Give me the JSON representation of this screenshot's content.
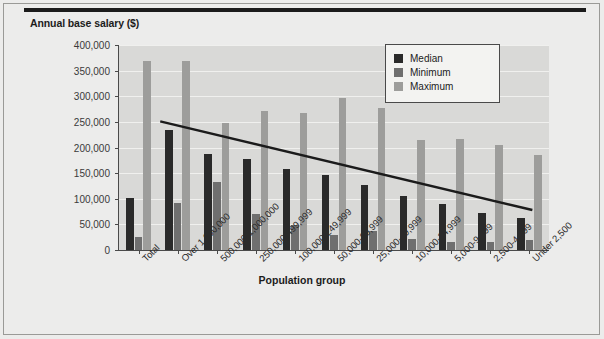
{
  "figure": {
    "y_axis_title": "Annual base salary ($)",
    "x_axis_title": "Population group"
  },
  "legend": {
    "items": [
      {
        "label": "Median",
        "color": "#2a2a2a",
        "swatch_name": "legend-swatch-median"
      },
      {
        "label": "Minimum",
        "color": "#6f6f6f",
        "swatch_name": "legend-swatch-minimum"
      },
      {
        "label": "Maximum",
        "color": "#9d9d9b",
        "swatch_name": "legend-swatch-maximum"
      }
    ]
  },
  "chart_data": {
    "type": "bar",
    "title": "",
    "xlabel": "Population group",
    "ylabel": "Annual base salary ($)",
    "ylim": [
      0,
      400000
    ],
    "ytick_labels": [
      "400,000",
      "350,000",
      "300,000",
      "250,000",
      "200,000",
      "150,000",
      "100,000",
      "50,000",
      "0"
    ],
    "ytick_values": [
      400000,
      350000,
      300000,
      250000,
      200000,
      150000,
      100000,
      50000,
      0
    ],
    "grid": true,
    "legend_position": "top-right",
    "categories": [
      "Total",
      "Over 1,000,000",
      "500,000-1,000,000",
      "250,000-499,999",
      "100,000-249,999",
      "50,000-99,999",
      "25,000-49,999",
      "10,000-24,999",
      "5,000-9,999",
      "2,500-4,999",
      "Under 2,500"
    ],
    "series": [
      {
        "name": "Median",
        "color": "#2a2a2a",
        "values": [
          101000,
          235000,
          187000,
          178000,
          158000,
          147000,
          127000,
          106000,
          89000,
          72000,
          62000
        ]
      },
      {
        "name": "Minimum",
        "color": "#6f6f6f",
        "values": [
          25000,
          92000,
          132000,
          70000,
          49000,
          30000,
          37000,
          22000,
          16000,
          15000,
          19000
        ]
      },
      {
        "name": "Maximum",
        "color": "#9d9d9b",
        "values": [
          368000,
          368000,
          248000,
          272000,
          268000,
          296000,
          277000,
          215000,
          217000,
          204000,
          185000
        ]
      }
    ],
    "trendline": {
      "name": "Median trend",
      "color": "#1b1b1b",
      "start": {
        "category_index": 1,
        "value": 251000
      },
      "end": {
        "category_index": 10,
        "value": 78000
      }
    }
  }
}
